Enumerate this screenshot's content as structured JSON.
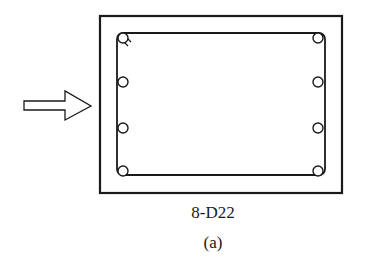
{
  "figure": {
    "rebar_label": "8-D22",
    "caption": "(a)"
  },
  "section": {
    "outer_outline": {
      "x": 100,
      "y": 16,
      "width": 242,
      "height": 177
    },
    "stirrup": {
      "x": 117,
      "y": 33,
      "width": 208,
      "height": 142,
      "corner_radius": 6
    },
    "bars_count": 8,
    "bar_positions": [
      {
        "x": 123,
        "y": 38
      },
      {
        "x": 123,
        "y": 82
      },
      {
        "x": 123,
        "y": 128
      },
      {
        "x": 123,
        "y": 171
      },
      {
        "x": 318,
        "y": 38
      },
      {
        "x": 318,
        "y": 82
      },
      {
        "x": 318,
        "y": 128
      },
      {
        "x": 318,
        "y": 171
      }
    ],
    "bar_radius": 5
  },
  "load_arrow": {
    "direction": "right",
    "icon": "hollow-arrow-right-icon"
  },
  "colors": {
    "line": "#1a1a1a",
    "background": "#ffffff"
  }
}
